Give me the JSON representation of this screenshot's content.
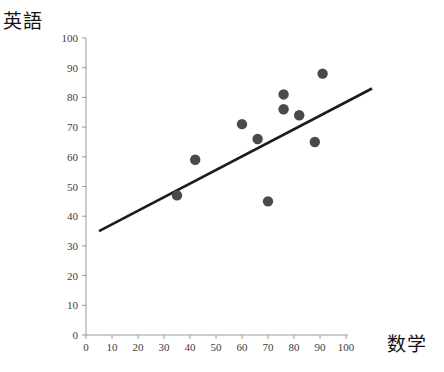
{
  "chart_data": {
    "type": "scatter",
    "title": "",
    "xlabel": "数学",
    "ylabel": "英語",
    "xlim": [
      0,
      100
    ],
    "ylim": [
      0,
      100
    ],
    "xticks": [
      0,
      10,
      20,
      30,
      40,
      50,
      60,
      70,
      80,
      90,
      100
    ],
    "yticks": [
      0,
      10,
      20,
      30,
      40,
      50,
      60,
      70,
      80,
      90,
      100
    ],
    "grid": false,
    "legend": null,
    "point_color": "#4a4a4a",
    "line_color": "#1c1c1c",
    "axis_color": "#9a9a9a",
    "points": [
      {
        "x": 35,
        "y": 47
      },
      {
        "x": 42,
        "y": 59
      },
      {
        "x": 60,
        "y": 71
      },
      {
        "x": 66,
        "y": 66
      },
      {
        "x": 70,
        "y": 45
      },
      {
        "x": 76,
        "y": 81
      },
      {
        "x": 76,
        "y": 76
      },
      {
        "x": 82,
        "y": 74
      },
      {
        "x": 88,
        "y": 65
      },
      {
        "x": 91,
        "y": 88
      }
    ],
    "trendline": {
      "x0": 5,
      "y0": 35,
      "x1": 110,
      "y1": 83
    }
  },
  "labels": {
    "y_axis_title": "英語",
    "x_axis_title": "数学"
  }
}
